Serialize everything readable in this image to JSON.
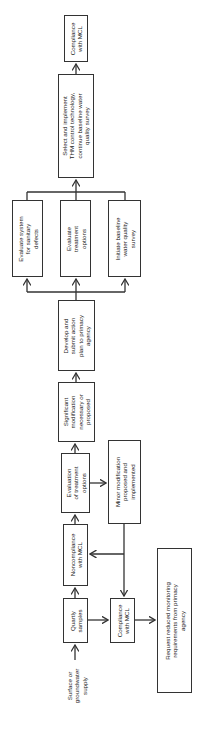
{
  "diagram": {
    "orientation": "rotated-90-ccw",
    "start_label": "Surface or\ngroundwater\nsupply",
    "nodes": {
      "quarterly": "Quartly\nsamples",
      "noncompliance": "Noncompliance\nwith MCL",
      "compliance_low": "Compliance\nwith MCL",
      "request": "Request reduced monitoring\nrequirements from primacy\nagency",
      "eval_options": "Evaluation\nof treatment\noptions",
      "minor": "Minor modification\nproposed and\nimplemented",
      "significant": "Significant\nmodification\nnecessary or\nproposed",
      "develop": "Develop and\nsubmit action\nplan to primacy\nagency",
      "eval_sanitary": "Evaluate system\nfor sanitary\ndefects",
      "eval_treatment": "Evaluate\ntreatment\noptions",
      "baseline": "Initiate baseline\nwater quality\nsurvey",
      "select": "Select and implement\nTHM control technology,\ncontinue baseline water\nquality survey",
      "compliance_top": "Compliance\nwith MCL"
    },
    "edges": [
      [
        "start_label",
        "quarterly"
      ],
      [
        "quarterly",
        "noncompliance"
      ],
      [
        "quarterly",
        "compliance_low"
      ],
      [
        "compliance_low",
        "request"
      ],
      [
        "noncompliance",
        "eval_options"
      ],
      [
        "eval_options",
        "minor"
      ],
      [
        "eval_options",
        "significant"
      ],
      [
        "minor",
        "noncompliance"
      ],
      [
        "minor",
        "compliance_low"
      ],
      [
        "significant",
        "develop"
      ],
      [
        "develop",
        "eval_sanitary"
      ],
      [
        "develop",
        "eval_treatment"
      ],
      [
        "develop",
        "baseline"
      ],
      [
        "eval_sanitary",
        "select"
      ],
      [
        "eval_treatment",
        "select"
      ],
      [
        "baseline",
        "select"
      ],
      [
        "select",
        "compliance_top"
      ]
    ]
  }
}
